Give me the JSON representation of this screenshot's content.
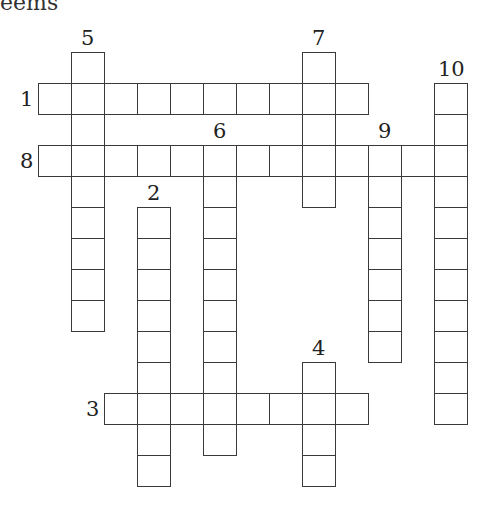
{
  "header": {
    "partial_text": "eems"
  },
  "grid": {
    "origin_x": 38,
    "origin_y": 52,
    "cell_w": 33,
    "cell_h": 31,
    "cols": 13,
    "rows": 14
  },
  "clues": [
    {
      "number": "1",
      "direction": "across",
      "row": 1,
      "col": 0,
      "length": 10,
      "label_pos": "left"
    },
    {
      "number": "8",
      "direction": "across",
      "row": 3,
      "col": 0,
      "length": 13,
      "label_pos": "left"
    },
    {
      "number": "3",
      "direction": "across",
      "row": 11,
      "col": 2,
      "length": 8,
      "label_pos": "left"
    },
    {
      "number": "5",
      "direction": "down",
      "row": 0,
      "col": 1,
      "length": 9,
      "label_pos": "top"
    },
    {
      "number": "7",
      "direction": "down",
      "row": 0,
      "col": 8,
      "length": 5,
      "label_pos": "top"
    },
    {
      "number": "10",
      "direction": "down",
      "row": 1,
      "col": 12,
      "length": 11,
      "label_pos": "top"
    },
    {
      "number": "6",
      "direction": "down",
      "row": 3,
      "col": 5,
      "length": 10,
      "label_pos": "top"
    },
    {
      "number": "9",
      "direction": "down",
      "row": 3,
      "col": 10,
      "length": 7,
      "label_pos": "top"
    },
    {
      "number": "2",
      "direction": "down",
      "row": 5,
      "col": 3,
      "length": 9,
      "label_pos": "top"
    },
    {
      "number": "4",
      "direction": "down",
      "row": 10,
      "col": 8,
      "length": 4,
      "label_pos": "top"
    }
  ]
}
